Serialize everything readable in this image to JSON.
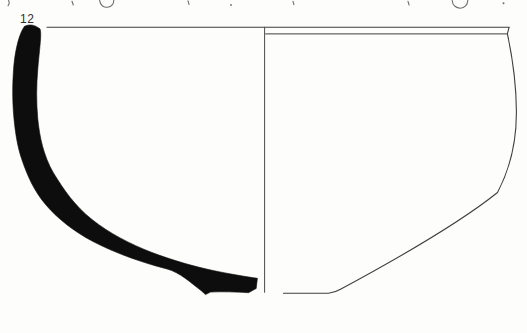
{
  "figure": {
    "vessel_number": "12",
    "colors": {
      "section_fill": "#0d0d0d",
      "line_ink": "#3f3f3f",
      "fragment_ink": "#6e6e6e",
      "paper": "#fdfdfb"
    }
  }
}
